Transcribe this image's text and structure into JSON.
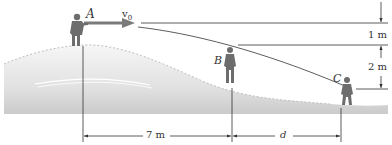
{
  "figure": {
    "points": [
      {
        "id": "A",
        "label": "A"
      },
      {
        "id": "B",
        "label": "B"
      },
      {
        "id": "C",
        "label": "C"
      }
    ],
    "velocity_label": "v",
    "velocity_subscript": "0",
    "dimensions": {
      "vertical_1": "1 m",
      "vertical_2": "2 m",
      "horizontal_1": "7 m",
      "horizontal_2": "d"
    },
    "colors": {
      "line": "#333333",
      "arrow": "#7a7a7a",
      "hill_top": "#f4f4f4",
      "hill_bottom": "#cfcfcf",
      "figure": "#6d6d6d"
    }
  }
}
